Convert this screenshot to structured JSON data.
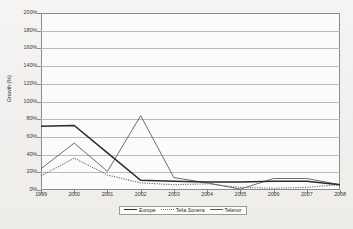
{
  "chart_data": {
    "type": "line",
    "title": "",
    "xlabel": "",
    "ylabel": "Growth (%)",
    "ylim": [
      0,
      200
    ],
    "ytick_labels": [
      "200%",
      "180%",
      "160%",
      "140%",
      "120%",
      "100%",
      "80%",
      "60%",
      "40%",
      "20%",
      "0%"
    ],
    "ytick_values": [
      200,
      180,
      160,
      140,
      120,
      100,
      80,
      60,
      40,
      20,
      0
    ],
    "grid": true,
    "legend_position": "bottom",
    "categories": [
      "1999",
      "2000",
      "2001",
      "2002",
      "2003",
      "2004",
      "2005",
      "2006",
      "2007",
      "2008"
    ],
    "x": [
      1999,
      2000,
      2001,
      2002,
      2003,
      2004,
      2005,
      2006,
      2007,
      2008
    ],
    "series": [
      {
        "name": "Europe",
        "style": "solid-thick",
        "color": "#2a2a2a",
        "values": [
          72,
          73,
          42,
          11,
          10,
          9,
          9,
          10,
          10,
          6
        ]
      },
      {
        "name": "Telia Sonera",
        "style": "dotted",
        "color": "#6e6e6e",
        "values": [
          16,
          36,
          17,
          8,
          6,
          7,
          3,
          2,
          3,
          6
        ]
      },
      {
        "name": "Telenor",
        "style": "solid-thin",
        "color": "#5d5d5d",
        "values": [
          24,
          53,
          21,
          84,
          14,
          8,
          1,
          13,
          13,
          6
        ]
      }
    ]
  },
  "axis": {
    "y_title": "Growth (%)"
  },
  "legend": {
    "items": [
      {
        "label": "Europe"
      },
      {
        "label": "Telia Sonera"
      },
      {
        "label": "Telenor"
      }
    ]
  }
}
